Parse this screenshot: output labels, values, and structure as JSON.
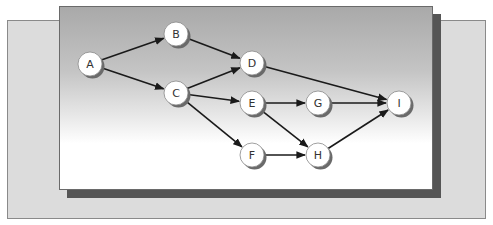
{
  "diagram": {
    "type": "directed-network",
    "nodes": [
      {
        "id": "A",
        "label": "A",
        "x": 90,
        "y": 64
      },
      {
        "id": "B",
        "label": "B",
        "x": 176,
        "y": 34
      },
      {
        "id": "C",
        "label": "C",
        "x": 176,
        "y": 93
      },
      {
        "id": "D",
        "label": "D",
        "x": 252,
        "y": 63
      },
      {
        "id": "E",
        "label": "E",
        "x": 252,
        "y": 103
      },
      {
        "id": "F",
        "label": "F",
        "x": 252,
        "y": 155
      },
      {
        "id": "G",
        "label": "G",
        "x": 318,
        "y": 103
      },
      {
        "id": "H",
        "label": "H",
        "x": 318,
        "y": 155
      },
      {
        "id": "I",
        "label": "I",
        "x": 399,
        "y": 103
      }
    ],
    "edges": [
      {
        "from": "A",
        "to": "B"
      },
      {
        "from": "A",
        "to": "C"
      },
      {
        "from": "B",
        "to": "D"
      },
      {
        "from": "C",
        "to": "D"
      },
      {
        "from": "C",
        "to": "E"
      },
      {
        "from": "C",
        "to": "F"
      },
      {
        "from": "D",
        "to": "I"
      },
      {
        "from": "E",
        "to": "G"
      },
      {
        "from": "E",
        "to": "H"
      },
      {
        "from": "F",
        "to": "H"
      },
      {
        "from": "G",
        "to": "I"
      },
      {
        "from": "H",
        "to": "I"
      }
    ]
  },
  "colors": {
    "back_panel": "#dcdcdc",
    "shadow": "#555555",
    "edge": "#1a1a1a",
    "node_fill": "#ffffff",
    "node_shadow": "#6a6a6a"
  }
}
